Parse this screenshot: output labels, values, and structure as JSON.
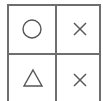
{
  "board": {
    "rows": 2,
    "cols": 2,
    "line_color": "#6e6e6e",
    "symbol_color": "#555555",
    "cells": [
      {
        "row": 0,
        "col": 0,
        "symbol": "circle",
        "icon": "circle-icon"
      },
      {
        "row": 0,
        "col": 1,
        "symbol": "cross",
        "icon": "x-icon"
      },
      {
        "row": 1,
        "col": 0,
        "symbol": "triangle",
        "icon": "triangle-icon"
      },
      {
        "row": 1,
        "col": 1,
        "symbol": "cross",
        "icon": "x-icon"
      }
    ]
  }
}
